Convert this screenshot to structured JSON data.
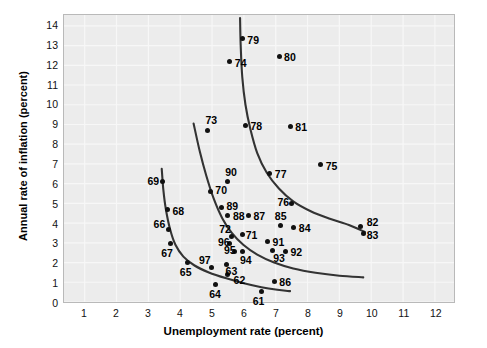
{
  "chart_data": {
    "type": "scatter",
    "title": "",
    "xlabel": "Unemployment rate (percent)",
    "ylabel": "Annual rate of inflation (percent)",
    "xlim": [
      0.35,
      12.6
    ],
    "ylim": [
      0,
      14.55
    ],
    "xticks": [
      1,
      2,
      3,
      4,
      5,
      6,
      7,
      8,
      9,
      10,
      11,
      12
    ],
    "yticks": [
      0,
      1,
      2,
      3,
      4,
      5,
      6,
      7,
      8,
      9,
      10,
      11,
      12,
      13,
      14
    ],
    "grid": true,
    "legend": "none",
    "point_color": "#111111",
    "curve_color": "#333333",
    "panel_color": "#ececec",
    "gridline_color": "#f7f7f7",
    "points": [
      {
        "label": "61",
        "x": 6.55,
        "y": 0.6,
        "lx": 6.28,
        "ly": 0.12,
        "anchor": "start"
      },
      {
        "label": "62",
        "x": 5.5,
        "y": 1.45,
        "lx": 5.68,
        "ly": 1.18,
        "anchor": "start"
      },
      {
        "label": "63",
        "x": 5.45,
        "y": 1.95,
        "lx": 5.43,
        "ly": 1.62,
        "anchor": "start"
      },
      {
        "label": "64",
        "x": 5.1,
        "y": 0.95,
        "lx": 4.92,
        "ly": 0.45,
        "anchor": "start"
      },
      {
        "label": "65",
        "x": 4.25,
        "y": 2.05,
        "lx": 4.0,
        "ly": 1.55,
        "anchor": "start"
      },
      {
        "label": "66",
        "x": 3.65,
        "y": 3.7,
        "lx": 3.18,
        "ly": 3.98,
        "anchor": "start"
      },
      {
        "label": "67",
        "x": 3.7,
        "y": 3.0,
        "lx": 3.42,
        "ly": 2.5,
        "anchor": "start"
      },
      {
        "label": "68",
        "x": 3.6,
        "y": 4.7,
        "lx": 3.77,
        "ly": 4.62,
        "anchor": "start"
      },
      {
        "label": "69",
        "x": 3.45,
        "y": 6.1,
        "lx": 2.99,
        "ly": 6.12,
        "anchor": "start"
      },
      {
        "label": "70",
        "x": 4.95,
        "y": 5.6,
        "lx": 5.11,
        "ly": 5.7,
        "anchor": "start"
      },
      {
        "label": "71",
        "x": 5.95,
        "y": 3.45,
        "lx": 6.06,
        "ly": 3.42,
        "anchor": "start"
      },
      {
        "label": "72",
        "x": 5.6,
        "y": 3.35,
        "lx": 5.23,
        "ly": 3.72,
        "anchor": "start"
      },
      {
        "label": "73",
        "x": 4.85,
        "y": 8.7,
        "lx": 4.8,
        "ly": 9.22,
        "anchor": "start"
      },
      {
        "label": "74",
        "x": 5.55,
        "y": 12.15,
        "lx": 5.72,
        "ly": 12.06,
        "anchor": "start"
      },
      {
        "label": "75",
        "x": 8.4,
        "y": 6.95,
        "lx": 8.56,
        "ly": 6.92,
        "anchor": "start"
      },
      {
        "label": "76",
        "x": 7.5,
        "y": 5.0,
        "lx": 7.05,
        "ly": 5.06,
        "anchor": "start"
      },
      {
        "label": "77",
        "x": 6.8,
        "y": 6.5,
        "lx": 6.97,
        "ly": 6.48,
        "anchor": "start"
      },
      {
        "label": "78",
        "x": 6.05,
        "y": 8.95,
        "lx": 6.21,
        "ly": 8.92,
        "anchor": "start"
      },
      {
        "label": "79",
        "x": 5.95,
        "y": 13.3,
        "lx": 6.11,
        "ly": 13.26,
        "anchor": "start"
      },
      {
        "label": "80",
        "x": 7.1,
        "y": 12.4,
        "lx": 7.26,
        "ly": 12.36,
        "anchor": "start"
      },
      {
        "label": "81",
        "x": 7.45,
        "y": 8.9,
        "lx": 7.61,
        "ly": 8.86,
        "anchor": "start"
      },
      {
        "label": "82",
        "x": 9.65,
        "y": 3.85,
        "lx": 9.84,
        "ly": 4.1,
        "anchor": "start"
      },
      {
        "label": "83",
        "x": 9.75,
        "y": 3.5,
        "lx": 9.84,
        "ly": 3.4,
        "anchor": "start"
      },
      {
        "label": "84",
        "x": 7.55,
        "y": 3.8,
        "lx": 7.72,
        "ly": 3.76,
        "anchor": "start"
      },
      {
        "label": "85",
        "x": 7.15,
        "y": 3.9,
        "lx": 6.97,
        "ly": 4.36,
        "anchor": "start"
      },
      {
        "label": "86",
        "x": 6.95,
        "y": 1.1,
        "lx": 7.11,
        "ly": 1.06,
        "anchor": "start"
      },
      {
        "label": "87",
        "x": 6.15,
        "y": 4.4,
        "lx": 6.3,
        "ly": 4.38,
        "anchor": "start"
      },
      {
        "label": "88",
        "x": 5.5,
        "y": 4.4,
        "lx": 5.66,
        "ly": 4.38,
        "anchor": "start"
      },
      {
        "label": "89",
        "x": 5.3,
        "y": 4.8,
        "lx": 5.46,
        "ly": 4.9,
        "anchor": "start"
      },
      {
        "label": "90",
        "x": 5.5,
        "y": 6.1,
        "lx": 5.42,
        "ly": 6.58,
        "anchor": "start"
      },
      {
        "label": "91",
        "x": 6.75,
        "y": 3.1,
        "lx": 6.9,
        "ly": 3.08,
        "anchor": "start"
      },
      {
        "label": "92",
        "x": 7.3,
        "y": 2.6,
        "lx": 7.46,
        "ly": 2.58,
        "anchor": "start"
      },
      {
        "label": "93",
        "x": 6.9,
        "y": 2.65,
        "lx": 6.92,
        "ly": 2.26,
        "anchor": "start"
      },
      {
        "label": "94",
        "x": 5.95,
        "y": 2.6,
        "lx": 5.88,
        "ly": 2.18,
        "anchor": "start"
      },
      {
        "label": "95",
        "x": 5.7,
        "y": 2.6,
        "lx": 5.38,
        "ly": 2.66,
        "anchor": "start"
      },
      {
        "label": "96",
        "x": 5.55,
        "y": 3.0,
        "lx": 5.19,
        "ly": 3.06,
        "anchor": "start"
      },
      {
        "label": "97",
        "x": 5.0,
        "y": 1.8,
        "lx": 4.6,
        "ly": 2.16,
        "anchor": "start"
      }
    ],
    "curves": [
      {
        "name": "curve-1960s",
        "points": [
          [
            3.42,
            6.75
          ],
          [
            3.47,
            5.7
          ],
          [
            3.55,
            4.7
          ],
          [
            3.68,
            3.7
          ],
          [
            3.85,
            2.9
          ],
          [
            4.1,
            2.3
          ],
          [
            4.45,
            1.85
          ],
          [
            4.9,
            1.5
          ],
          [
            5.45,
            1.2
          ],
          [
            6.0,
            0.95
          ],
          [
            6.55,
            0.75
          ],
          [
            7.05,
            0.62
          ],
          [
            7.45,
            0.55
          ]
        ]
      },
      {
        "name": "curve-1970s",
        "points": [
          [
            4.42,
            9.05
          ],
          [
            4.62,
            7.6
          ],
          [
            4.82,
            6.4
          ],
          [
            5.05,
            5.25
          ],
          [
            5.32,
            4.25
          ],
          [
            5.62,
            3.5
          ],
          [
            5.98,
            2.9
          ],
          [
            6.42,
            2.4
          ],
          [
            6.95,
            2.0
          ],
          [
            7.55,
            1.7
          ],
          [
            8.25,
            1.48
          ],
          [
            9.0,
            1.33
          ],
          [
            9.75,
            1.25
          ]
        ]
      },
      {
        "name": "curve-1980s",
        "points": [
          [
            5.88,
            14.4
          ],
          [
            5.9,
            13.0
          ],
          [
            5.95,
            11.4
          ],
          [
            6.05,
            10.0
          ],
          [
            6.2,
            8.8
          ],
          [
            6.42,
            7.55
          ],
          [
            6.72,
            6.55
          ],
          [
            7.1,
            5.75
          ],
          [
            7.55,
            5.1
          ],
          [
            8.1,
            4.6
          ],
          [
            8.7,
            4.22
          ],
          [
            9.3,
            3.9
          ],
          [
            9.8,
            3.55
          ]
        ]
      }
    ]
  }
}
